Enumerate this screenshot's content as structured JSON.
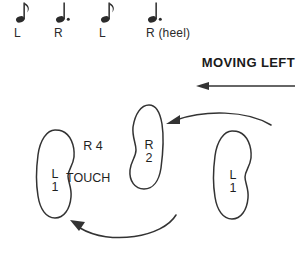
{
  "figure": {
    "background_color": "#ffffff",
    "ink_color": "#333333"
  },
  "rhythm": {
    "notes": [
      {
        "glyph": "eighth-note",
        "duration": "eighth",
        "dotted": false,
        "label": "L",
        "x": 14
      },
      {
        "glyph": "dotted-quarter-note",
        "duration": "quarter",
        "dotted": true,
        "label": "R",
        "x": 54
      },
      {
        "glyph": "eighth-note",
        "duration": "eighth",
        "dotted": false,
        "label": "L",
        "x": 99
      },
      {
        "glyph": "dotted-quarter-note",
        "duration": "quarter",
        "dotted": true,
        "label": "R (heel)",
        "x": 146
      }
    ]
  },
  "direction": {
    "label": "MOVING LEFT",
    "arrow": "straight-arrow-left",
    "arrow_color": "#333333"
  },
  "footprints": [
    {
      "id": "left-foot-far-left",
      "side": "left",
      "foot_letter": "L",
      "beat": "1",
      "x": 33,
      "y": 129,
      "width": 46,
      "height": 88
    },
    {
      "id": "right-foot-middle",
      "side": "right",
      "foot_letter": "R",
      "beat": "2",
      "x": 128,
      "y": 104,
      "width": 42,
      "height": 84
    },
    {
      "id": "left-foot-right",
      "side": "left",
      "foot_letter": "L",
      "beat": "1",
      "x": 211,
      "y": 130,
      "width": 44,
      "height": 88
    }
  ],
  "annotations": [
    {
      "id": "r-four",
      "line1": "R",
      "line2": "4",
      "x": 82,
      "y": 140
    },
    {
      "id": "touch",
      "text": "TOUCH",
      "x": 66,
      "y": 178
    }
  ],
  "motion_arcs": [
    {
      "id": "upper-arc",
      "description": "curved arrow from right foot position toward middle right foot",
      "from": "left-foot-right",
      "to": "right-foot-middle",
      "arrowhead": "left"
    },
    {
      "id": "lower-arc",
      "description": "curved arrow sweeping from right toward far-left foot",
      "from": "right-area",
      "to": "left-foot-far-left",
      "arrowhead": "upper-left"
    }
  ]
}
